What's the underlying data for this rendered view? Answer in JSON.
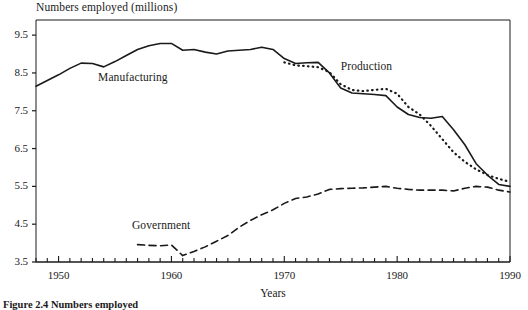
{
  "figure": {
    "caption": "Figure 2.4 Numbers employed"
  },
  "chart_data": {
    "type": "line",
    "title": "",
    "ylabel": "Numbers employed (millions)",
    "xlabel": "Years",
    "xlim": [
      1948,
      1990
    ],
    "ylim": [
      3.5,
      9.9
    ],
    "yticks": [
      3.5,
      4.5,
      5.5,
      6.5,
      7.5,
      8.5,
      9.5
    ],
    "ytick_labels": [
      "3.5",
      "4.5",
      "5.5",
      "6.5",
      "7.5",
      "8.5",
      "9.5"
    ],
    "xticks": [
      1950,
      1960,
      1970,
      1980,
      1990
    ],
    "xtick_labels": [
      "1950",
      "1960",
      "1970",
      "1980",
      "1990"
    ],
    "minor_xtick_interval": 1,
    "grid": false,
    "legend": "inline-labels",
    "series": [
      {
        "name": "Manufacturing",
        "style": "solid",
        "color": "#1a1a1a",
        "label_x": 1953.5,
        "label_y": 8.35,
        "x": [
          1948,
          1949,
          1950,
          1951,
          1952,
          1953,
          1954,
          1955,
          1956,
          1957,
          1958,
          1959,
          1960,
          1961,
          1962,
          1963,
          1964,
          1965,
          1966,
          1967,
          1968,
          1969,
          1970,
          1971,
          1972,
          1973,
          1974,
          1975,
          1976,
          1977,
          1978,
          1979,
          1980,
          1981,
          1982,
          1983,
          1984,
          1985,
          1986,
          1987,
          1988,
          1989,
          1990
        ],
        "y": [
          8.15,
          8.3,
          8.45,
          8.62,
          8.76,
          8.75,
          8.66,
          8.8,
          8.96,
          9.12,
          9.22,
          9.28,
          9.28,
          9.1,
          9.12,
          9.05,
          9.0,
          9.08,
          9.1,
          9.12,
          9.18,
          9.12,
          8.88,
          8.75,
          8.77,
          8.78,
          8.5,
          8.1,
          7.97,
          7.95,
          7.93,
          7.9,
          7.6,
          7.4,
          7.32,
          7.3,
          7.35,
          7.0,
          6.6,
          6.1,
          5.8,
          5.55,
          5.5
        ]
      },
      {
        "name": "Production",
        "style": "dotted",
        "color": "#1a1a1a",
        "label_x": 1975.0,
        "label_y": 8.62,
        "x": [
          1970,
          1971,
          1972,
          1973,
          1974,
          1975,
          1976,
          1977,
          1978,
          1979,
          1980,
          1981,
          1982,
          1983,
          1984,
          1985,
          1986,
          1987,
          1988,
          1989,
          1990
        ],
        "y": [
          8.78,
          8.7,
          8.68,
          8.65,
          8.52,
          8.2,
          8.05,
          8.02,
          8.05,
          8.08,
          7.95,
          7.6,
          7.4,
          7.1,
          6.75,
          6.4,
          6.15,
          5.95,
          5.8,
          5.7,
          5.62
        ]
      },
      {
        "name": "Government",
        "style": "dashed",
        "color": "#1a1a1a",
        "label_x": 1956.5,
        "label_y": 4.42,
        "x": [
          1957,
          1958,
          1959,
          1960,
          1961,
          1962,
          1963,
          1964,
          1965,
          1966,
          1967,
          1968,
          1969,
          1970,
          1971,
          1972,
          1973,
          1974,
          1975,
          1976,
          1977,
          1978,
          1979,
          1980,
          1981,
          1982,
          1983,
          1984,
          1985,
          1986,
          1987,
          1988,
          1989,
          1990
        ],
        "y": [
          3.96,
          3.94,
          3.93,
          3.95,
          3.67,
          3.78,
          3.9,
          4.05,
          4.2,
          4.42,
          4.6,
          4.75,
          4.88,
          5.05,
          5.18,
          5.22,
          5.3,
          5.42,
          5.44,
          5.45,
          5.46,
          5.48,
          5.5,
          5.45,
          5.42,
          5.4,
          5.4,
          5.4,
          5.38,
          5.45,
          5.5,
          5.48,
          5.4,
          5.35
        ]
      }
    ]
  }
}
